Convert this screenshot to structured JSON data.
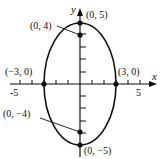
{
  "figure": {
    "type": "ellipse-graph",
    "equation_hint": "x^2/9 + y^2/25 = 1",
    "axes": {
      "x_label": "x",
      "y_label": "y",
      "x_ticks": [
        "-5",
        "5"
      ]
    },
    "points": [
      {
        "label": "(0, 5)",
        "x": 0,
        "y": 5
      },
      {
        "label": "(0, 4)",
        "x": 0,
        "y": 4
      },
      {
        "label": "(−3, 0)",
        "x": -3,
        "y": 0
      },
      {
        "label": "(3, 0)",
        "x": 3,
        "y": 0
      },
      {
        "label": "(0, −4)",
        "x": 0,
        "y": -4
      },
      {
        "label": "(0, −5)",
        "x": 0,
        "y": -5
      }
    ]
  }
}
